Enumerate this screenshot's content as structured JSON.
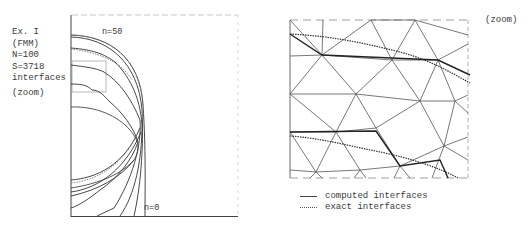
{
  "left_panel": {
    "info_lines": [
      "Ex. I",
      "(FMM)",
      "N=100",
      "S=3718",
      "interfaces"
    ],
    "zoom_label": "(zoom)",
    "curve_labels": {
      "top": "n=50",
      "bottom": "n=0"
    }
  },
  "right_panel": {
    "zoom_label": "(zoom)",
    "legend": [
      {
        "style": "solid",
        "label": "computed interfaces"
      },
      {
        "style": "dotted",
        "label": "exact interfaces"
      }
    ]
  },
  "colors": {
    "line": "#333333",
    "frame": "#555555",
    "background": "#ffffff"
  }
}
